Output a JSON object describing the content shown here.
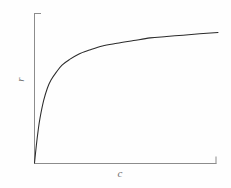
{
  "figure": {
    "background_color": "#fefefe",
    "axis_color": "#8c8c8c",
    "curve_color": "#2b2b2b",
    "label_color": "#6f6f6f",
    "y_axis_label": "r",
    "x_axis_label": "c"
  },
  "chart_data": {
    "type": "line",
    "title": "",
    "subtitle": "",
    "xlabel": "c",
    "ylabel": "r",
    "xlim": [
      0,
      1
    ],
    "ylim": [
      0,
      1
    ],
    "grid": false,
    "legend": null,
    "axis_ticks": {
      "x_tick_labels": [],
      "y_tick_labels": [],
      "note": "No numeric tick labels are printed; only short end-caps at the far ends of each axis."
    },
    "series": [
      {
        "name": "saturation curve",
        "description": "Monotonic rising curve that starts at the origin, climbs very steeply, then bends over and approaches a horizontal asymptote (Langmuir / Michaelis-Menten shape).",
        "x": [
          0.0,
          0.01,
          0.02,
          0.03,
          0.05,
          0.07,
          0.09,
          0.12,
          0.15,
          0.19,
          0.24,
          0.3,
          0.37,
          0.45,
          0.54,
          0.63,
          0.72,
          0.81,
          0.9,
          1.0
        ],
        "y": [
          0.0,
          0.13,
          0.24,
          0.33,
          0.46,
          0.55,
          0.61,
          0.67,
          0.72,
          0.76,
          0.8,
          0.83,
          0.86,
          0.88,
          0.9,
          0.92,
          0.93,
          0.94,
          0.95,
          0.96
        ]
      }
    ],
    "annotations": []
  }
}
